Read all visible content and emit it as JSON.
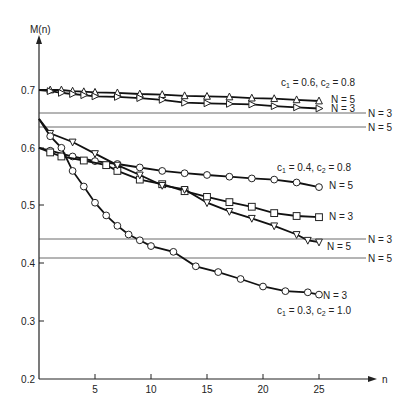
{
  "chart_data": {
    "type": "line",
    "title": "",
    "xlabel": "n",
    "ylabel": "M(n)",
    "xlim": [
      0,
      27
    ],
    "ylim": [
      0.2,
      0.75
    ],
    "x_ticks": [
      5,
      10,
      15,
      20,
      25
    ],
    "y_ticks": [
      0.2,
      0.3,
      0.4,
      0.5,
      0.6,
      0.7
    ],
    "grid": false,
    "legend": "inline labels",
    "series": [
      {
        "name": "c1 = 0.6, c2 = 0.8, N = 5",
        "group": "c1 = 0.6, c2 = 0.8",
        "label": "N = 5",
        "marker": "triangle-up",
        "x": [
          0,
          1,
          2,
          3,
          4,
          5,
          7,
          9,
          11,
          13,
          15,
          17,
          19,
          21,
          23,
          25
        ],
        "values": [
          0.7,
          0.7,
          0.7,
          0.698,
          0.697,
          0.696,
          0.695,
          0.693,
          0.692,
          0.69,
          0.689,
          0.688,
          0.686,
          0.685,
          0.683,
          0.681
        ]
      },
      {
        "name": "c1 = 0.6, c2 = 0.8, N = 3",
        "group": "c1 = 0.6, c2 = 0.8",
        "label": "N = 3",
        "marker": "triangle-right",
        "x": [
          0,
          1,
          2,
          3,
          4,
          5,
          7,
          9,
          11,
          13,
          15,
          17,
          19,
          21,
          23,
          25
        ],
        "values": [
          0.7,
          0.698,
          0.695,
          0.693,
          0.691,
          0.689,
          0.688,
          0.686,
          0.683,
          0.678,
          0.677,
          0.676,
          0.675,
          0.672,
          0.67,
          0.668
        ]
      },
      {
        "name": "c1 = 0.4, c2 = 0.8, N = 5",
        "group": "c1 = 0.4, c2 = 0.8",
        "label": "N = 5",
        "marker": "circle",
        "x": [
          0,
          1,
          3,
          5,
          7,
          9,
          11,
          13,
          15,
          17,
          19,
          21,
          23,
          25
        ],
        "values": [
          0.6,
          0.595,
          0.585,
          0.577,
          0.572,
          0.566,
          0.56,
          0.556,
          0.553,
          0.55,
          0.547,
          0.545,
          0.54,
          0.532
        ]
      },
      {
        "name": "c1 = 0.4, c2 = 0.8, N = 3",
        "group": "c1 = 0.4, c2 = 0.8",
        "label": "N = 3",
        "marker": "square",
        "x": [
          0,
          1,
          2,
          4,
          6,
          7,
          9,
          11,
          13,
          15,
          17,
          19,
          21,
          23,
          25
        ],
        "values": [
          0.6,
          0.592,
          0.585,
          0.578,
          0.57,
          0.56,
          0.545,
          0.537,
          0.525,
          0.515,
          0.506,
          0.498,
          0.487,
          0.482,
          0.48
        ]
      },
      {
        "name": "c1 = 0.4, c2 = 0.8 (lower), N = 5",
        "group": "c1 = 0.4, c2 = 0.8",
        "label": "N = 5",
        "marker": "triangle-down",
        "x": [
          0,
          1,
          3,
          5,
          7,
          9,
          11,
          13,
          15,
          17,
          19,
          21,
          23,
          24,
          25
        ],
        "values": [
          0.65,
          0.625,
          0.61,
          0.59,
          0.57,
          0.553,
          0.535,
          0.528,
          0.505,
          0.49,
          0.478,
          0.465,
          0.45,
          0.44,
          0.437
        ]
      },
      {
        "name": "c1 = 0.3, c2 = 1.0, N = 3",
        "group": "c1 = 0.3, c2 = 1.0",
        "label": "N = 3",
        "marker": "circle",
        "x": [
          0,
          1,
          2,
          3,
          4,
          5,
          6,
          7,
          8,
          9,
          10,
          12,
          14,
          16,
          18,
          20,
          22,
          24,
          25
        ],
        "values": [
          0.65,
          0.62,
          0.6,
          0.56,
          0.533,
          0.505,
          0.483,
          0.465,
          0.45,
          0.44,
          0.43,
          0.42,
          0.395,
          0.385,
          0.373,
          0.36,
          0.352,
          0.35,
          0.346
        ]
      }
    ],
    "reference_lines": [
      {
        "y": 0.66,
        "label": "N = 3",
        "group": "c1 = 0.6, c2 = 0.8"
      },
      {
        "y": 0.635,
        "label": "N = 5",
        "group": "c1 = 0.6, c2 = 0.8"
      },
      {
        "y": 0.442,
        "label": "N = 3",
        "group": "lower"
      },
      {
        "y": 0.41,
        "label": "N = 5",
        "group": "lower"
      }
    ],
    "annotations": [
      "c1 = 0.6, c2 = 0.8",
      "c1 = 0.4, c2 = 0.8",
      "c1 = 0.3, c2 = 1.0"
    ]
  },
  "labels": {
    "y_axis": "M(n)",
    "x_axis": "n",
    "y_ticks": [
      "0.7",
      "0.6",
      "0.5",
      "0.4",
      "0.3",
      "0.2"
    ],
    "x_ticks": [
      "5",
      "10",
      "15",
      "20",
      "25"
    ],
    "ann_top": {
      "c1": "c",
      "s1": "1",
      "v1": " = 0.6, ",
      "c2": "c",
      "s2": "2",
      "v2": " = 0.8"
    },
    "ann_mid": {
      "c1": "c",
      "s1": "1",
      "v1": " = 0.4, ",
      "c2": "c",
      "s2": "2",
      "v2": " = 0.8"
    },
    "ann_low": {
      "c1": "c",
      "s1": "1",
      "v1": " = 0.3, ",
      "c2": "c",
      "s2": "2",
      "v2": " = 1.0"
    },
    "top_n5": "N = 5",
    "top_n3": "N = 3",
    "ref1": "N = 3",
    "ref2": "N = 5",
    "mid_circle": "N = 5",
    "mid_square": "N = 3",
    "ref3": "N = 3",
    "mid_tri": "N = 5",
    "ref4": "N = 5",
    "low_circle": "N = 3"
  }
}
